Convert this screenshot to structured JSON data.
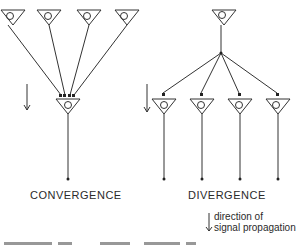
{
  "diagram": {
    "convergence": {
      "label": "CONVERGENCE",
      "input_neurons": 4,
      "output_neurons": 1
    },
    "divergence": {
      "label": "DIVERGENCE",
      "input_neurons": 1,
      "output_neurons": 4
    },
    "legend": {
      "line1": "direction of",
      "line2": "signal propagation",
      "icon": "down-arrow-icon"
    },
    "colors": {
      "stroke": "#333333",
      "background": "#ffffff"
    }
  }
}
